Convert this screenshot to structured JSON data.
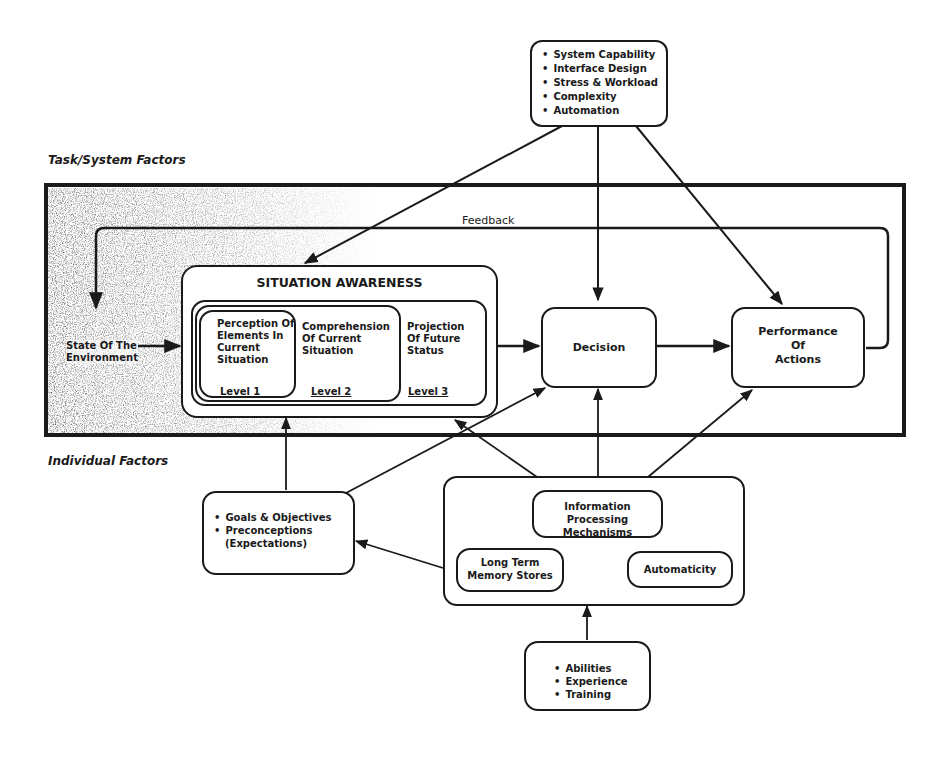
{
  "diagram": {
    "region_labels": {
      "task_system": "Task/System Factors",
      "individual": "Individual Factors"
    },
    "system_factors": {
      "items": [
        "System Capability",
        "Interface Design",
        "Stress & Workload",
        "Complexity",
        "Automation"
      ]
    },
    "feedback_label": "Feedback",
    "environment": {
      "line1": "State Of The",
      "line2": "Environment"
    },
    "situation_awareness": {
      "title": "SITUATION AWARENESS",
      "levels": [
        {
          "text": "Perception Of Elements In Current Situation",
          "level": "Level 1"
        },
        {
          "text": "Comprehension Of Current Situation",
          "level": "Level 2"
        },
        {
          "text": "Projection Of Future Status",
          "level": "Level 3"
        }
      ]
    },
    "decision": "Decision",
    "performance": {
      "line1": "Performance",
      "line2": "Of",
      "line3": "Actions"
    },
    "goals": {
      "items": [
        "Goals & Objectives",
        "Preconceptions"
      ],
      "sub": "(Expectations)"
    },
    "processing": {
      "info": {
        "line1": "Information Processing",
        "line2": "Mechanisms"
      },
      "memory": {
        "line1": "Long Term",
        "line2": "Memory Stores"
      },
      "automaticity": "Automaticity"
    },
    "abilities": {
      "items": [
        "Abilities",
        "Experience",
        "Training"
      ]
    },
    "colors": {
      "ink": "#1a1a1a",
      "paper": "#ffffff"
    }
  }
}
